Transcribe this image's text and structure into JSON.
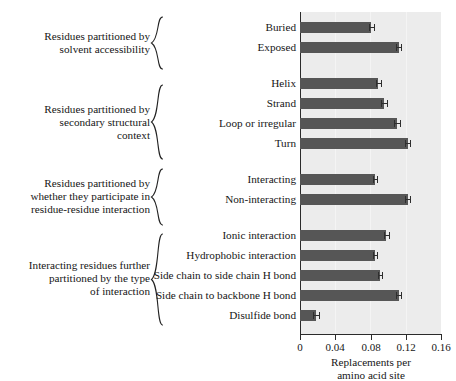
{
  "figure": {
    "kind": "grouped-horizontal-bar-chart",
    "panel_background": "#ececec",
    "bar_color": "#565656",
    "axis_color": "#2b2b2b"
  },
  "chart_data": {
    "type": "bar",
    "orientation": "horizontal",
    "title": "",
    "xlabel": "Replacements per amino acid site",
    "ylabel": "",
    "xlim": [
      0,
      0.16
    ],
    "xticks": [
      0,
      0.04,
      0.08,
      0.12,
      0.16
    ],
    "xticklabels": [
      "0",
      "0.04",
      "0.08",
      "0.12",
      "0.16"
    ],
    "grid": true,
    "legend": "none",
    "categories": [
      "Buried",
      "Exposed",
      "Helix",
      "Strand",
      "Loop or irregular",
      "Turn",
      "Interacting",
      "Non-interacting",
      "Ionic interaction",
      "Hydrophobic interaction",
      "Side chain to side chain H bond",
      "Side chain to backbone H bond",
      "Disulfide bond"
    ],
    "values": [
      0.081,
      0.112,
      0.089,
      0.095,
      0.11,
      0.122,
      0.085,
      0.122,
      0.098,
      0.085,
      0.091,
      0.112,
      0.018
    ],
    "errors": [
      0.0025,
      0.003,
      0.0025,
      0.0035,
      0.003,
      0.003,
      0.002,
      0.003,
      0.003,
      0.0025,
      0.0022,
      0.003,
      0.0035
    ],
    "groups": [
      {
        "description": "Residues partitioned by solvent accessibility",
        "description_lines": [
          "Residues partitioned by",
          "solvent accessibility"
        ],
        "members": [
          "Buried",
          "Exposed"
        ]
      },
      {
        "description": "Residues partitioned by secondary structural context",
        "description_lines": [
          "Residues partitioned by",
          "secondary structural",
          "context"
        ],
        "members": [
          "Helix",
          "Strand",
          "Loop or irregular",
          "Turn"
        ]
      },
      {
        "description": "Residues partitioned by whether they participate in residue-residue interaction",
        "description_lines": [
          "Residues partitioned by",
          "whether they participate in",
          "residue-residue interaction"
        ],
        "members": [
          "Interacting",
          "Non-interacting"
        ]
      },
      {
        "description": "Interacting residues further partitioned by the type of interaction",
        "description_lines": [
          "Interacting residues further",
          "partitioned by the type",
          "of interaction"
        ],
        "members": [
          "Ionic interaction",
          "Hydrophobic interaction",
          "Side chain to side chain H bond",
          "Side chain to backbone H bond",
          "Disulfide bond"
        ]
      }
    ]
  },
  "axis": {
    "tick_labels": [
      "0",
      "0.04",
      "0.08",
      "0.12",
      "0.16"
    ],
    "title_line1": "Replacements per",
    "title_line2": "amino acid site"
  },
  "bars": [
    {
      "label": "Buried",
      "value": 0.081,
      "error": 0.0025
    },
    {
      "label": "Exposed",
      "value": 0.112,
      "error": 0.003
    },
    {
      "label": "Helix",
      "value": 0.089,
      "error": 0.0025
    },
    {
      "label": "Strand",
      "value": 0.095,
      "error": 0.0035
    },
    {
      "label": "Loop or irregular",
      "value": 0.11,
      "error": 0.003
    },
    {
      "label": "Turn",
      "value": 0.122,
      "error": 0.003
    },
    {
      "label": "Interacting",
      "value": 0.085,
      "error": 0.002
    },
    {
      "label": "Non-interacting",
      "value": 0.122,
      "error": 0.003
    },
    {
      "label": "Ionic interaction",
      "value": 0.098,
      "error": 0.003
    },
    {
      "label": "Hydrophobic interaction",
      "value": 0.085,
      "error": 0.0025
    },
    {
      "label": "Side chain to side chain H bond",
      "value": 0.091,
      "error": 0.0022
    },
    {
      "label": "Side chain to backbone H bond",
      "value": 0.112,
      "error": 0.003
    },
    {
      "label": "Disulfide bond",
      "value": 0.018,
      "error": 0.0035
    }
  ],
  "groups": [
    {
      "id": "solvent-accessibility",
      "lines": [
        "Residues partitioned by",
        "solvent accessibility"
      ]
    },
    {
      "id": "secondary-structure",
      "lines": [
        "Residues partitioned by",
        "secondary structural",
        "context"
      ]
    },
    {
      "id": "residue-interaction",
      "lines": [
        "Residues partitioned by",
        "whether they participate in",
        "residue-residue interaction"
      ]
    },
    {
      "id": "interaction-type",
      "lines": [
        "Interacting residues further",
        "partitioned by the type",
        "of interaction"
      ]
    }
  ]
}
